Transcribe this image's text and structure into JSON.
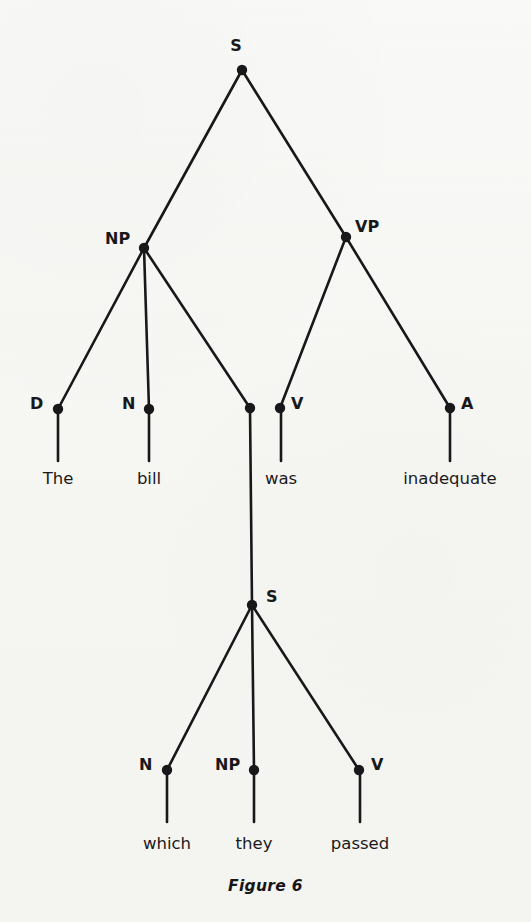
{
  "figure": {
    "caption": "Figure 6",
    "background_color": "#f7f7f5",
    "ink_color": "#18181a"
  },
  "chart_data": {
    "type": "diagram",
    "diagram_kind": "constituency-syntax-tree",
    "title": "Figure 6",
    "sentence": "The bill which they passed was inadequate",
    "nodes": [
      {
        "id": "S1",
        "label": "S",
        "x": 242,
        "y": 70,
        "label_x": 236,
        "label_y": 38,
        "label_align": "center"
      },
      {
        "id": "NP1",
        "label": "NP",
        "x": 144,
        "y": 248,
        "label_x": 105,
        "label_y": 231,
        "label_align": "left"
      },
      {
        "id": "VP1",
        "label": "VP",
        "x": 346,
        "y": 237,
        "label_x": 355,
        "label_y": 219,
        "label_align": "left"
      },
      {
        "id": "D1",
        "label": "D",
        "x": 58,
        "y": 409,
        "label_x": 30,
        "label_y": 396,
        "label_align": "left"
      },
      {
        "id": "N1",
        "label": "N",
        "x": 149,
        "y": 409,
        "label_x": 122,
        "label_y": 396,
        "label_align": "left"
      },
      {
        "id": "X1",
        "label": "",
        "x": 250,
        "y": 408,
        "label_x": 0,
        "label_y": 0,
        "label_align": "none"
      },
      {
        "id": "V1",
        "label": "V",
        "x": 280,
        "y": 408,
        "label_x": 291,
        "label_y": 396,
        "label_align": "left"
      },
      {
        "id": "A1",
        "label": "A",
        "x": 450,
        "y": 408,
        "label_x": 461,
        "label_y": 396,
        "label_align": "left"
      },
      {
        "id": "S2",
        "label": "S",
        "x": 252,
        "y": 605,
        "label_x": 266,
        "label_y": 589,
        "label_align": "left"
      },
      {
        "id": "N2",
        "label": "N",
        "x": 167,
        "y": 770,
        "label_x": 139,
        "label_y": 757,
        "label_align": "left"
      },
      {
        "id": "NP2",
        "label": "NP",
        "x": 254,
        "y": 770,
        "label_x": 215,
        "label_y": 757,
        "label_align": "left"
      },
      {
        "id": "V2",
        "label": "V",
        "x": 359,
        "y": 770,
        "label_x": 371,
        "label_y": 757,
        "label_align": "left"
      }
    ],
    "edges": [
      {
        "from": "S1",
        "to": "NP1"
      },
      {
        "from": "S1",
        "to": "VP1"
      },
      {
        "from": "NP1",
        "to": "D1"
      },
      {
        "from": "NP1",
        "to": "N1"
      },
      {
        "from": "NP1",
        "to": "X1"
      },
      {
        "from": "VP1",
        "to": "V1"
      },
      {
        "from": "VP1",
        "to": "A1"
      },
      {
        "from": "X1",
        "to": "S2"
      },
      {
        "from": "S2",
        "to": "N2"
      },
      {
        "from": "S2",
        "to": "NP2"
      },
      {
        "from": "S2",
        "to": "V2"
      }
    ],
    "terminals": [
      {
        "id": "T1",
        "word": "The",
        "parent": "D1",
        "x": 58,
        "stem_top": 409,
        "stem_bottom": 461,
        "text_y": 471
      },
      {
        "id": "T2",
        "word": "bill",
        "parent": "N1",
        "x": 149,
        "stem_top": 409,
        "stem_bottom": 461,
        "text_y": 471
      },
      {
        "id": "T3",
        "word": "was",
        "parent": "V1",
        "x": 281,
        "stem_top": 408,
        "stem_bottom": 461,
        "text_y": 471
      },
      {
        "id": "T4",
        "word": "inadequate",
        "parent": "A1",
        "x": 450,
        "stem_top": 408,
        "stem_bottom": 461,
        "text_y": 471
      },
      {
        "id": "T5",
        "word": "which",
        "parent": "N2",
        "x": 167,
        "stem_top": 770,
        "stem_bottom": 822,
        "text_y": 836
      },
      {
        "id": "T6",
        "word": "they",
        "parent": "NP2",
        "x": 254,
        "stem_top": 770,
        "stem_bottom": 822,
        "text_y": 836
      },
      {
        "id": "T7",
        "word": "passed",
        "parent": "V2",
        "x": 360,
        "stem_top": 770,
        "stem_bottom": 822,
        "text_y": 836
      }
    ],
    "caption_y": 879,
    "node_radius": 5.2,
    "edge_width": 2.6,
    "stem_width": 2.6
  }
}
